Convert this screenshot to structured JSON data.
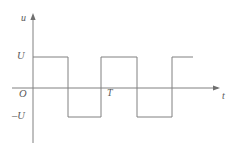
{
  "figure": {
    "name": "bipolar-square-wave-voltage-waveform",
    "background_color": "#ffffff",
    "line_color": "#808080",
    "text_color": "#5a5a5a",
    "line_width": 1
  },
  "axes": {
    "vertical": {
      "label": "u",
      "x": 33,
      "top": 14,
      "bottom": 143,
      "arrow": "up-arrow-icon"
    },
    "horizontal": {
      "label": "t",
      "y": 88,
      "left": 12,
      "right": 220,
      "arrow": "right-arrow-icon"
    },
    "origin_label": "O"
  },
  "ticks": {
    "high_label": "U",
    "high_y": 57,
    "low_label": "–U",
    "low_y": 117,
    "period_label": "T",
    "period_x": 101
  },
  "chart_data": {
    "type": "line",
    "title": "",
    "xlabel": "t",
    "ylabel": "u",
    "grid": false,
    "legend": null,
    "waveform": "square",
    "duty_cycle": 0.5,
    "amplitude_labels": [
      "U",
      "–U"
    ],
    "period_label": "T",
    "x_tick_labels": [
      "T"
    ],
    "y_tick_labels": [
      "U",
      "O",
      "–U"
    ],
    "x_values": [
      0,
      0,
      1,
      1,
      2,
      2,
      3,
      3,
      4,
      4,
      5
    ],
    "y_values": [
      1,
      1,
      1,
      -1,
      -1,
      1,
      1,
      -1,
      -1,
      1,
      1
    ],
    "points_px": [
      [
        33,
        57
      ],
      [
        68,
        57
      ],
      [
        68,
        117
      ],
      [
        101,
        117
      ],
      [
        101,
        57
      ],
      [
        137,
        57
      ],
      [
        137,
        117
      ],
      [
        172,
        117
      ],
      [
        172,
        57
      ],
      [
        193,
        57
      ]
    ],
    "xlim": [
      0,
      5
    ],
    "ylim": [
      -1.45,
      1.9
    ]
  }
}
